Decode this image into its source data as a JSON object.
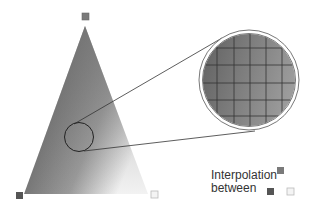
{
  "diagram": {
    "legend": {
      "line1": "Interpolation",
      "line2": "between"
    },
    "vertices": {
      "top": {
        "color": "#7a7a7a"
      },
      "bottom_left": {
        "color": "#555555"
      },
      "bottom_right": {
        "color": "#f4f4f4"
      }
    },
    "legend_swatches": {
      "top": "#7a7a7a",
      "left": "#555555",
      "right": "#f4f4f4"
    },
    "magnifier": {
      "grid_rows": 5,
      "grid_cols": 6,
      "grid_line_color": "#333333"
    }
  }
}
